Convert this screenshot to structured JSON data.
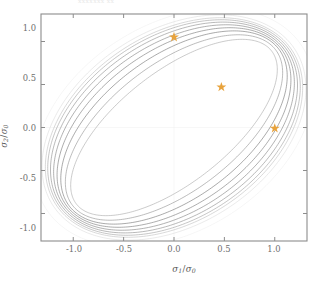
{
  "figure": {
    "top_note": "xxxxxxx xx",
    "background_color": "#ffffff"
  },
  "axes": {
    "frame_color": "#8c8c8c",
    "x_label_parts": {
      "var": "σ",
      "sub": "1",
      "slash": "/",
      "denom_var": "σ",
      "denom_sub": "0"
    },
    "y_label_parts": {
      "var": "σ",
      "sub": "2",
      "slash": "/",
      "denom_var": "σ",
      "denom_sub": "0"
    },
    "x_ticks": [
      "-1.0",
      "-0.5",
      "0.0",
      "0.5",
      "1.0"
    ],
    "y_ticks": [
      "1.0",
      "0.5",
      "0.0",
      "-0.5",
      "-1.0"
    ]
  },
  "chart_data": {
    "type": "line",
    "title": "",
    "subtitle": "",
    "xlabel": "σ₁/σ₀",
    "ylabel": "σ₂/σ₀",
    "xlim": [
      -1.32,
      1.32
    ],
    "ylim": [
      -1.32,
      1.32
    ],
    "xticks": [
      -1.0,
      -0.5,
      0.0,
      0.5,
      1.0
    ],
    "yticks": [
      -1.0,
      -0.5,
      0.0,
      0.5,
      1.0
    ],
    "grid": false,
    "legend": null,
    "annotations": [],
    "series": [
      {
        "name": "envelope-1",
        "shape": "ellipse",
        "semi_major": 1.52,
        "semi_minor": 1.06,
        "rotation_deg": 45,
        "color": "#d8d8d8",
        "linewidth": 0.55
      },
      {
        "name": "envelope-2",
        "shape": "ellipse",
        "semi_major": 1.49,
        "semi_minor": 1.02,
        "rotation_deg": 45,
        "color": "#b9b9b9",
        "linewidth": 0.55
      },
      {
        "name": "envelope-3",
        "shape": "ellipse",
        "semi_major": 1.47,
        "semi_minor": 0.99,
        "rotation_deg": 45,
        "color": "#9f9f9f",
        "linewidth": 0.6
      },
      {
        "name": "envelope-4",
        "shape": "ellipse",
        "semi_major": 1.45,
        "semi_minor": 0.95,
        "rotation_deg": 45,
        "color": "#8a8a8a",
        "linewidth": 0.6
      },
      {
        "name": "envelope-5",
        "shape": "ellipse",
        "semi_major": 1.43,
        "semi_minor": 0.9,
        "rotation_deg": 45,
        "color": "#7d7d7d",
        "linewidth": 0.6
      },
      {
        "name": "envelope-6",
        "shape": "ellipse",
        "semi_major": 1.41,
        "semi_minor": 0.84,
        "rotation_deg": 45,
        "color": "#757575",
        "linewidth": 0.6
      },
      {
        "name": "envelope-7",
        "shape": "ellipse",
        "semi_major": 1.39,
        "semi_minor": 0.77,
        "rotation_deg": 45,
        "color": "#707070",
        "linewidth": 0.6
      },
      {
        "name": "envelope-8",
        "shape": "ellipse",
        "semi_major": 1.36,
        "semi_minor": 0.69,
        "rotation_deg": 45,
        "color": "#8e8e8e",
        "linewidth": 0.6
      },
      {
        "name": "envelope-9",
        "shape": "ellipse",
        "semi_major": 1.32,
        "semi_minor": 0.6,
        "rotation_deg": 45,
        "color": "#a8a8a8",
        "linewidth": 0.6
      },
      {
        "name": "envelope-outer-faint",
        "shape": "ellipse",
        "semi_major": 1.6,
        "semi_minor": 1.13,
        "rotation_deg": 45,
        "color": "#ededed",
        "linewidth": 0.5
      }
    ],
    "markers": {
      "name": "reference-points",
      "symbol": "star",
      "color": "#e8a33d",
      "size": 9,
      "points": [
        {
          "label": "biaxial-top",
          "x": 0.0,
          "y": 1.05
        },
        {
          "label": "equibiaxial",
          "x": 0.47,
          "y": 0.47
        },
        {
          "label": "uniaxial-right",
          "x": 1.0,
          "y": -0.01
        }
      ]
    }
  }
}
